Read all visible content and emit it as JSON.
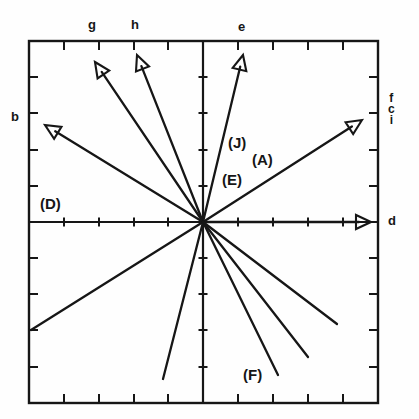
{
  "figure": {
    "type": "vector-diagram",
    "background": "#fefefe",
    "ink": "#161616",
    "frame": {
      "left": 29,
      "top": 41,
      "right": 378,
      "bottom": 403
    },
    "origin": {
      "x": 203,
      "y": 222
    }
  },
  "axes": {
    "x_ticks": [
      64,
      99,
      134,
      168,
      203,
      238,
      273,
      308,
      343
    ],
    "y_ticks": [
      77,
      113,
      150,
      186,
      222,
      258,
      294,
      330,
      367
    ],
    "tick_len": 9,
    "grid": false
  },
  "axis_labels": {
    "top_left_1": "g",
    "top_left_2": "h",
    "top_right": "e",
    "left": "b",
    "right": "d",
    "right_stack": [
      "f",
      "c",
      "i"
    ]
  },
  "annotations": [
    {
      "text": "(D)",
      "x": 40,
      "y": 196
    },
    {
      "text": "(J)",
      "x": 228,
      "y": 135
    },
    {
      "text": "(A)",
      "x": 252,
      "y": 152
    },
    {
      "text": "(E)",
      "x": 222,
      "y": 172
    },
    {
      "text": "(F)",
      "x": 243,
      "y": 367
    }
  ],
  "chart_data": {
    "type": "scatter",
    "title": "",
    "xlabel": "",
    "ylabel": "",
    "vectors": [
      {
        "name": "b",
        "label": "b",
        "arrow": true,
        "tip_x": 45,
        "tip_y": 125
      },
      {
        "name": "g",
        "label": "g",
        "arrow": true,
        "tip_x": 95,
        "tip_y": 62
      },
      {
        "name": "h",
        "label": "h",
        "arrow": true,
        "tip_x": 137,
        "tip_y": 55
      },
      {
        "name": "e",
        "label": "e",
        "arrow": true,
        "tip_x": 243,
        "tip_y": 55
      },
      {
        "name": "fci",
        "label": "f c i",
        "arrow": true,
        "tip_x": 362,
        "tip_y": 120
      },
      {
        "name": "d",
        "label": "d",
        "arrow": true,
        "tip_x": 371,
        "tip_y": 222
      },
      {
        "name": "v1",
        "label": "",
        "arrow": false,
        "tip_x": 31,
        "tip_y": 330
      },
      {
        "name": "v2",
        "label": "",
        "arrow": false,
        "tip_x": 163,
        "tip_y": 379
      },
      {
        "name": "v3",
        "label": "",
        "arrow": false,
        "tip_x": 278,
        "tip_y": 375
      },
      {
        "name": "v4",
        "label": "",
        "arrow": false,
        "tip_x": 308,
        "tip_y": 357
      },
      {
        "name": "v5",
        "label": "",
        "arrow": false,
        "tip_x": 337,
        "tip_y": 324
      }
    ]
  }
}
